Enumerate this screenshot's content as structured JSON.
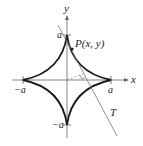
{
  "diagram": {
    "curve": "astroid",
    "labels": {
      "x_axis": "x",
      "y_axis": "y",
      "point": "P(x, y)",
      "tangent": "T",
      "a_top": "a",
      "a_right": "a",
      "a_left": "−a",
      "a_bottom": "−a"
    },
    "colors": {
      "curve": "#1a1a1a",
      "axes": "#555555",
      "tangent": "#777777",
      "text": "#222222"
    }
  }
}
